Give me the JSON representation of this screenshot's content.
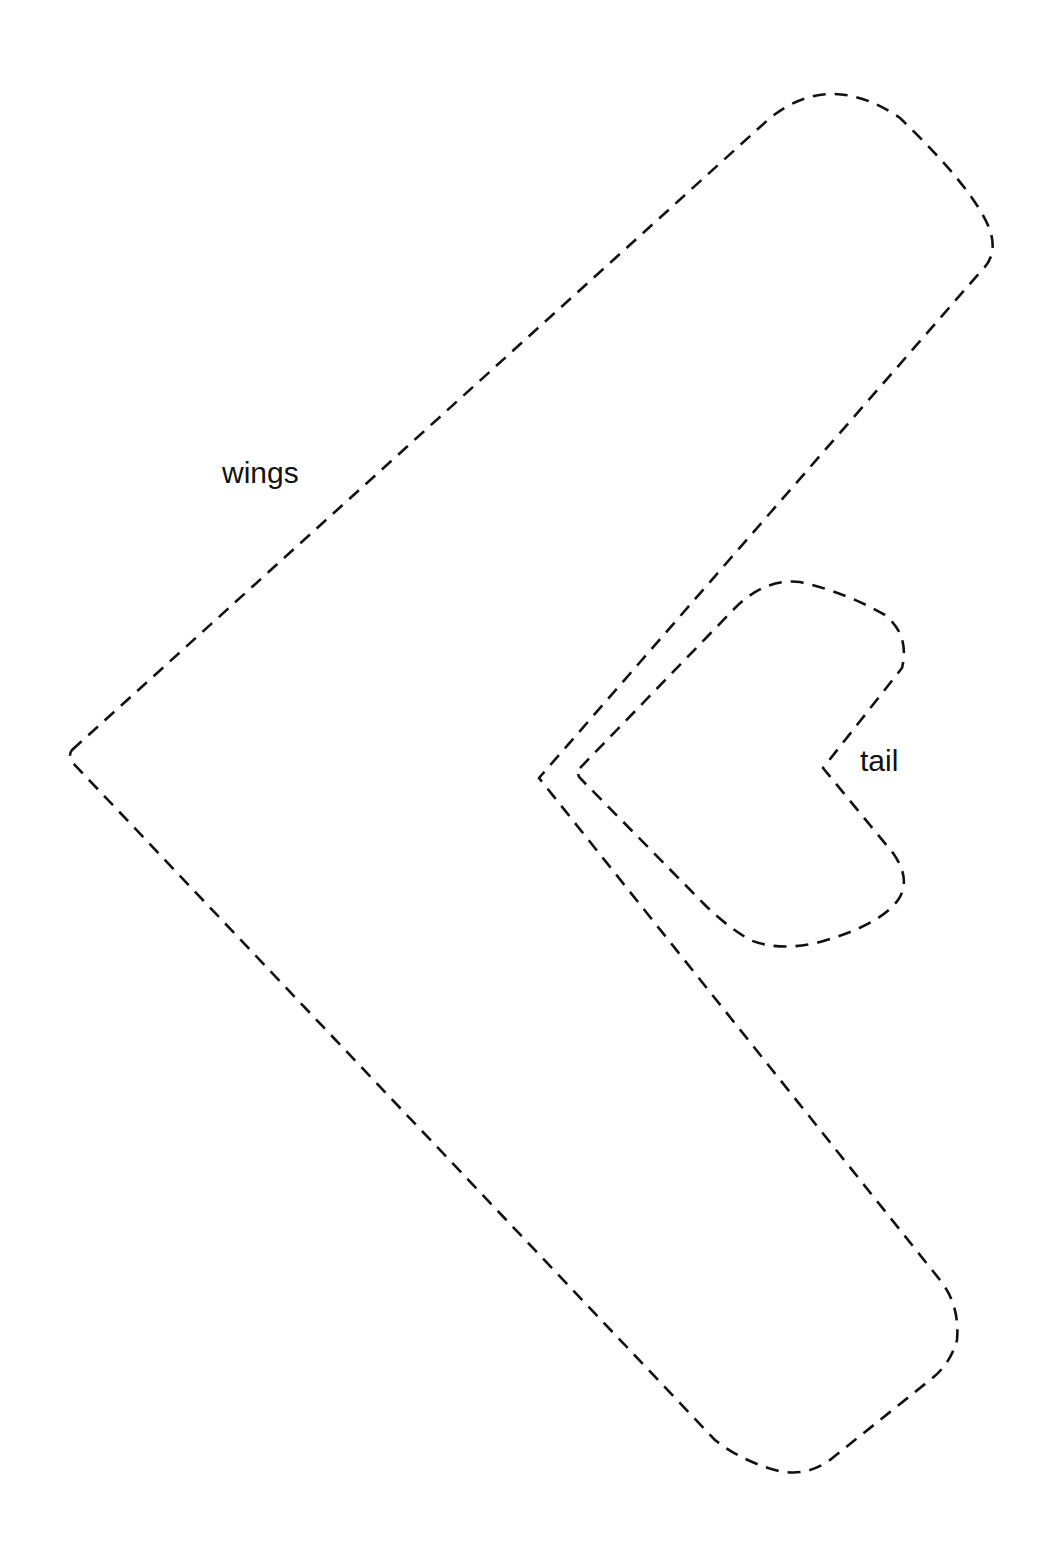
{
  "diagram": {
    "type": "cut-out template outline",
    "line_style": "dashed",
    "stroke_color": "#111111",
    "background_color": "#ffffff",
    "shapes": [
      {
        "id": "wings",
        "label": "wings",
        "description": "Large chevron / boomerang shape pointing left, with rounded top and bottom tips",
        "key_points": {
          "top_tip": [
            830,
            84
          ],
          "top_right_bulge": [
            993,
            240
          ],
          "left_vertex": [
            72,
            757
          ],
          "inner_vertex": [
            539,
            778
          ],
          "bottom_right_bulge": [
            957,
            1330
          ],
          "bottom_tip": [
            800,
            1475
          ]
        }
      },
      {
        "id": "tail",
        "label": "tail",
        "description": "Small heart-like chevron shape pointing left, nested inside the wings notch",
        "key_points": {
          "left_vertex": [
            580,
            773
          ],
          "top": [
            788,
            581
          ],
          "top_right": [
            905,
            640
          ],
          "notch": [
            823,
            768
          ],
          "bottom_right": [
            905,
            880
          ],
          "bottom": [
            785,
            948
          ]
        }
      }
    ]
  },
  "labels": {
    "wings": "wings",
    "tail": "tail"
  }
}
